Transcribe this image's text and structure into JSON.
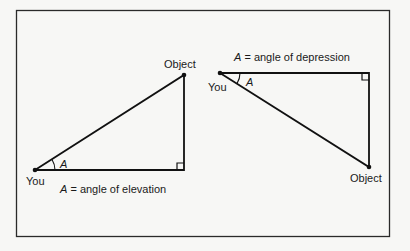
{
  "diagram": {
    "left_panel": {
      "observer_label": "You",
      "object_label": "Object",
      "angle_label": "A",
      "caption_var": "A",
      "caption_text": " = angle of elevation"
    },
    "right_panel": {
      "observer_label": "You",
      "object_label": "Object",
      "angle_label": "A",
      "caption_var": "A",
      "caption_text": " = angle of depression"
    }
  }
}
